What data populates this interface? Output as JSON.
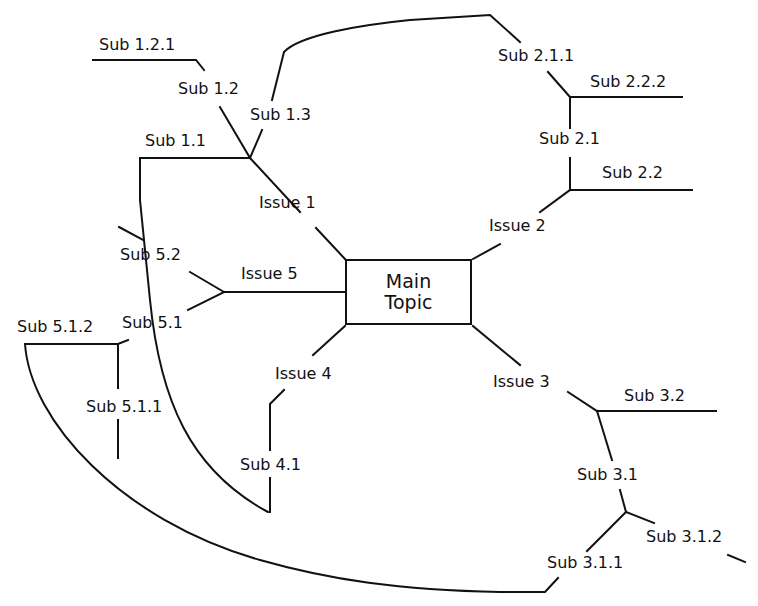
{
  "diagram": {
    "type": "mind-map",
    "main_topic": {
      "line1": "Main",
      "line2": "Topic"
    },
    "issues": [
      {
        "id": "issue-1",
        "label": "Issue 1"
      },
      {
        "id": "issue-2",
        "label": "Issue 2"
      },
      {
        "id": "issue-3",
        "label": "Issue 3"
      },
      {
        "id": "issue-4",
        "label": "Issue 4"
      },
      {
        "id": "issue-5",
        "label": "Issue 5"
      }
    ],
    "subs": {
      "s1_1": "Sub 1.1",
      "s1_2": "Sub 1.2",
      "s1_2_1": "Sub 1.2.1",
      "s1_3": "Sub 1.3",
      "s2_1": "Sub 2.1",
      "s2_1_1": "Sub 2.1.1",
      "s2_2": "Sub 2.2",
      "s2_2_2": "Sub 2.2.2",
      "s3_1": "Sub 3.1",
      "s3_1_1": "Sub 3.1.1",
      "s3_1_2": "Sub 3.1.2",
      "s3_2": "Sub 3.2",
      "s4_1": "Sub 4.1",
      "s5_1": "Sub 5.1",
      "s5_1_1": "Sub 5.1.1",
      "s5_1_2": "Sub 5.1.2",
      "s5_2": "Sub 5.2"
    },
    "cross_links": [
      {
        "from": "Sub 1.3",
        "to": "Sub 2.1.1"
      },
      {
        "from": "Sub 1.1",
        "to": "Sub 4.1"
      },
      {
        "from": "Sub 5.1.2",
        "to": "Sub 3.1.1"
      }
    ],
    "line_color": "#111111",
    "background": "#ffffff"
  }
}
